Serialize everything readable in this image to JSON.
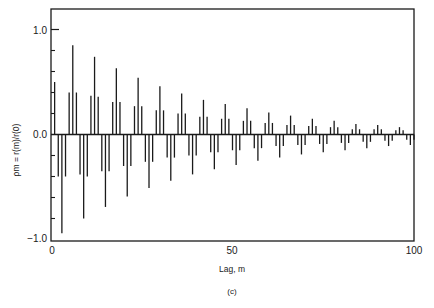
{
  "figure": {
    "caption": "(c)"
  },
  "chart_data": {
    "type": "bar",
    "subtype": "stem / autocorrelation plot",
    "title": "",
    "xlabel": "Lag, m",
    "ylabel": "ρm = r(m)/r(0)",
    "xlim": [
      0,
      100
    ],
    "ylim": [
      -1.0,
      1.2
    ],
    "x_ticks": [
      0,
      50,
      100
    ],
    "x_tick_labels": [
      "0",
      "50",
      "100"
    ],
    "y_ticks": [
      -1.0,
      0.0,
      1.0
    ],
    "y_tick_labels": [
      "−1.0",
      "0.0",
      "1.0"
    ],
    "y_minor_ticks": [
      -0.8,
      -0.6,
      -0.4,
      -0.2,
      0.2,
      0.4,
      0.6,
      0.8
    ],
    "grid": false,
    "legend": null,
    "annotations": [
      "(c)"
    ],
    "x": [
      1,
      2,
      3,
      4,
      5,
      6,
      7,
      8,
      9,
      10,
      11,
      12,
      13,
      14,
      15,
      16,
      17,
      18,
      19,
      20,
      21,
      22,
      23,
      24,
      25,
      26,
      27,
      28,
      29,
      30,
      31,
      32,
      33,
      34,
      35,
      36,
      37,
      38,
      39,
      40,
      41,
      42,
      43,
      44,
      45,
      46,
      47,
      48,
      49,
      50,
      51,
      52,
      53,
      54,
      55,
      56,
      57,
      58,
      59,
      60,
      61,
      62,
      63,
      64,
      65,
      66,
      67,
      68,
      69,
      70,
      71,
      72,
      73,
      74,
      75,
      76,
      77,
      78,
      79,
      80,
      81,
      82,
      83,
      84,
      85,
      86,
      87,
      88,
      89,
      90,
      91,
      92,
      93,
      94,
      95,
      96,
      97,
      98,
      99,
      100
    ],
    "values": [
      0.5,
      -0.4,
      -0.94,
      -0.4,
      0.4,
      0.85,
      0.4,
      -0.38,
      -0.8,
      -0.4,
      0.37,
      0.74,
      0.36,
      -0.35,
      -0.69,
      -0.35,
      0.31,
      0.63,
      0.31,
      -0.3,
      -0.59,
      -0.3,
      0.27,
      0.54,
      0.27,
      -0.26,
      -0.51,
      -0.26,
      0.23,
      0.46,
      0.23,
      -0.22,
      -0.44,
      -0.22,
      0.2,
      0.39,
      0.2,
      -0.2,
      -0.38,
      -0.2,
      0.17,
      0.33,
      0.17,
      -0.17,
      -0.33,
      -0.17,
      0.15,
      0.29,
      0.15,
      -0.15,
      -0.29,
      -0.15,
      0.13,
      0.25,
      0.13,
      -0.13,
      -0.25,
      -0.13,
      0.11,
      0.21,
      0.11,
      -0.11,
      -0.22,
      -0.11,
      0.09,
      0.18,
      0.09,
      -0.1,
      -0.19,
      -0.1,
      0.08,
      0.15,
      0.08,
      -0.09,
      -0.17,
      -0.09,
      0.07,
      0.13,
      0.07,
      -0.08,
      -0.15,
      -0.08,
      0.05,
      0.1,
      0.05,
      -0.07,
      -0.13,
      -0.07,
      0.05,
      0.09,
      0.05,
      -0.06,
      -0.11,
      -0.06,
      0.04,
      0.07,
      0.04,
      -0.05,
      -0.1,
      -0.05
    ],
    "series": [
      {
        "name": "ρm",
        "color": "#1a1a1a"
      }
    ]
  }
}
